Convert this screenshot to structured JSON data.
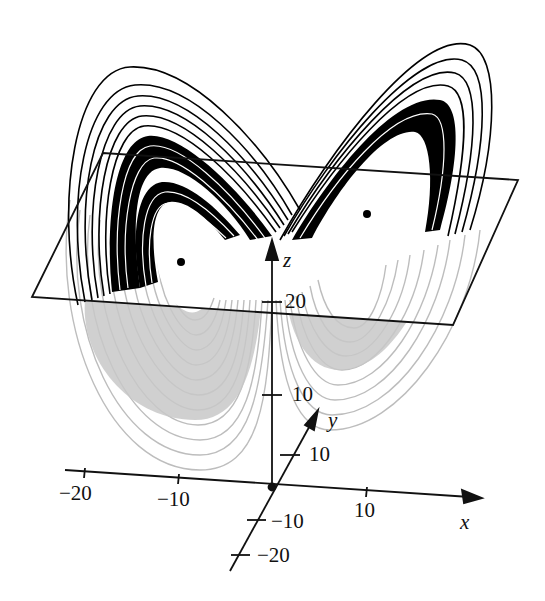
{
  "figure": {
    "colors": {
      "upper_trajectory": "#000000",
      "lower_trajectory": "#bdbdbd",
      "axes": "#111111",
      "background": "#ffffff"
    },
    "axes": {
      "x": {
        "label": "x",
        "ticks": [
          {
            "value": "−20"
          },
          {
            "value": "−10"
          },
          {
            "value": "10"
          }
        ]
      },
      "y": {
        "label": "y",
        "ticks": [
          {
            "value": "10"
          },
          {
            "value": "−10"
          },
          {
            "value": "−20"
          }
        ]
      },
      "z": {
        "label": "z",
        "ticks": [
          {
            "value": "10"
          },
          {
            "value": "20"
          }
        ]
      }
    },
    "fixed_points": [
      {
        "name": "left-equilibrium"
      },
      {
        "name": "right-equilibrium"
      }
    ],
    "plane": {
      "description": "horizontal cross-section plane at z ≈ 27"
    }
  }
}
